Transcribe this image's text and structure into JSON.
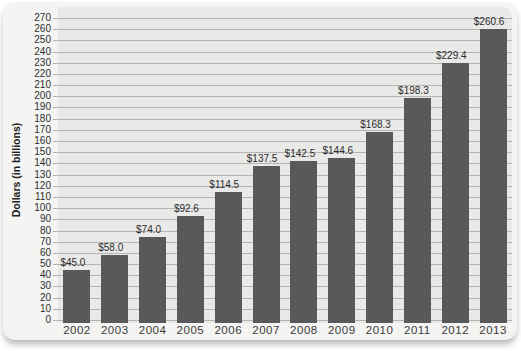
{
  "chart_data": {
    "type": "bar",
    "title": "",
    "xlabel": "",
    "ylabel": "Dollars (in billions)",
    "categories": [
      "2002",
      "2003",
      "2004",
      "2005",
      "2006",
      "2007",
      "2008",
      "2009",
      "2010",
      "2011",
      "2012",
      "2013"
    ],
    "values": [
      45.0,
      58.0,
      74.0,
      92.6,
      114.5,
      137.5,
      142.5,
      144.6,
      168.3,
      198.3,
      229.4,
      260.6
    ],
    "value_labels": [
      "$45.0",
      "$58.0",
      "$74.0",
      "$92.6",
      "$114.5",
      "$137.5",
      "$142.5",
      "$144.6",
      "$168.3",
      "$198.3",
      "$229.4",
      "$260.6"
    ],
    "ylim": [
      0,
      270
    ],
    "ytick_step": 10,
    "grid": true,
    "legend_position": "none",
    "colors": {
      "bar": "#58595b",
      "plot_background": "#e9e9e7",
      "grid_line": "#b3b3b1",
      "card_background": "#f4f4f2",
      "tick_text": "#2e2e2e"
    }
  }
}
